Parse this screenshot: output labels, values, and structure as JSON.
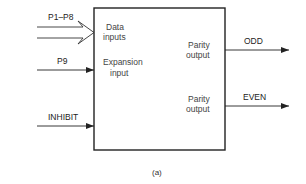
{
  "diagram": {
    "type": "block-diagram",
    "caption": "(a)",
    "block": {
      "inputs": [
        {
          "label": "Data",
          "label2": "inputs"
        },
        {
          "label": "Expansion",
          "label2": "input"
        }
      ],
      "outputs": [
        {
          "label": "Parity",
          "label2": "output"
        },
        {
          "label": "Parity",
          "label2": "output"
        }
      ]
    },
    "input_signals": [
      {
        "name": "P1–P8",
        "style": "bus-arrow"
      },
      {
        "name": "P9",
        "style": "arrow"
      },
      {
        "name": "INHIBIT",
        "style": "arrow"
      }
    ],
    "output_signals": [
      {
        "name": "ODD",
        "style": "arrow"
      },
      {
        "name": "EVEN",
        "style": "arrow"
      }
    ]
  }
}
